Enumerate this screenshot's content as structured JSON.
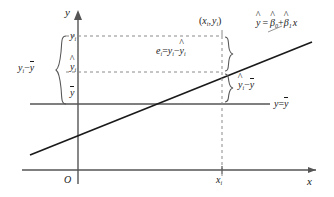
{
  "figure": {
    "type": "regression-decomposition-diagram"
  },
  "axes": {
    "y_axis_label": "y",
    "x_axis_label": "x",
    "origin_label": "O",
    "x_tick_label_base": "x",
    "x_tick_label_sub": "i"
  },
  "lines": {
    "regression": {
      "label_yhat": "y",
      "label_eq": "=",
      "label_b0": "β",
      "label_b0_sub": "0",
      "label_plus": "+",
      "label_b1": "β",
      "label_b1_sub": "1",
      "label_x": "x"
    },
    "mean": {
      "label_y": "y",
      "label_eq": "=",
      "label_ybar": "y"
    }
  },
  "points": {
    "observation": {
      "open_paren": "(",
      "x_base": "x",
      "x_sub": "i",
      "comma": ",",
      "y_base": "y",
      "y_sub": "i",
      "close_paren": ")"
    }
  },
  "value_labels": {
    "y_i": {
      "base": "y",
      "sub": "i"
    },
    "y_hat_i": {
      "base": "y",
      "sub": "i"
    },
    "y_bar": {
      "base": "y"
    }
  },
  "annotations": {
    "total_deviation": {
      "y_base": "y",
      "y_sub": "i",
      "minus": "−",
      "ybar": "y"
    },
    "residual": {
      "e_base": "e",
      "e_sub": "i",
      "eq": "=",
      "y_base": "y",
      "y_sub": "i",
      "minus": "−",
      "yhat_base": "y",
      "yhat_sub": "i"
    },
    "explained_deviation": {
      "yhat_base": "y",
      "yhat_sub": "i",
      "minus": "−",
      "ybar": "y"
    }
  },
  "colors": {
    "ink": "#1a1a1a",
    "axis": "#555555",
    "dashed": "#888888",
    "regression_line": "#1a1a1a",
    "background": "#ffffff"
  }
}
